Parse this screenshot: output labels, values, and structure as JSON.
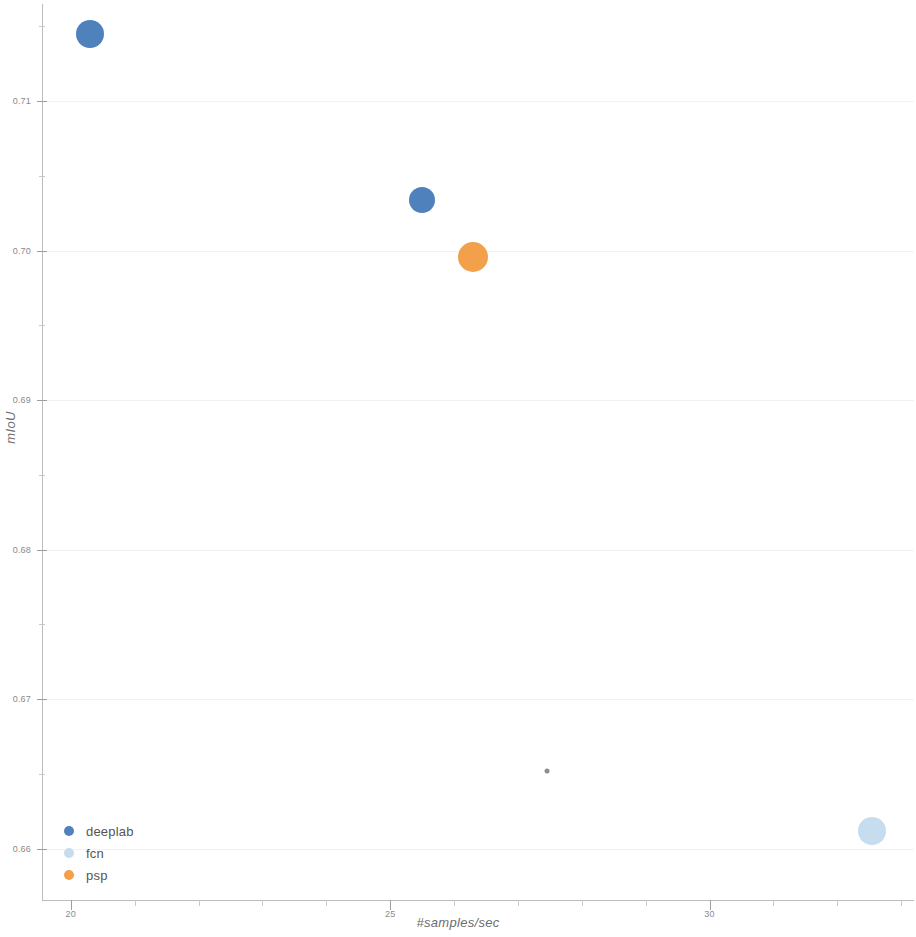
{
  "chart_data": {
    "type": "scatter",
    "title": "",
    "xlabel": "#samples/sec",
    "ylabel": "mIoU",
    "xlim": [
      19.55,
      33.2
    ],
    "ylim": [
      0.6565,
      0.7165
    ],
    "grid": true,
    "legend_position": "lower-left",
    "x_ticks": [
      {
        "value": 20,
        "label": "20"
      },
      {
        "value": 25,
        "label": "25"
      },
      {
        "value": 30,
        "label": "30"
      }
    ],
    "x_minor_ticks": [
      21,
      22,
      23,
      24,
      26,
      27,
      28,
      29,
      31,
      32,
      33
    ],
    "y_ticks": [
      {
        "value": 0.71,
        "label": "0.71"
      },
      {
        "value": 0.7,
        "label": "0.70"
      },
      {
        "value": 0.69,
        "label": "0.69"
      },
      {
        "value": 0.68,
        "label": "0.68"
      },
      {
        "value": 0.67,
        "label": "0.67"
      },
      {
        "value": 0.66,
        "label": "0.66"
      }
    ],
    "y_minor_ticks": [
      0.715,
      0.705,
      0.695,
      0.685,
      0.675,
      0.665
    ],
    "series": [
      {
        "name": "deeplab",
        "color": "#4f81bd",
        "points": [
          {
            "x": 20.3,
            "y": 0.7145,
            "size": 28
          },
          {
            "x": 25.5,
            "y": 0.7034,
            "size": 26
          }
        ]
      },
      {
        "name": "fcn",
        "color": "#c6dcef",
        "points": [
          {
            "x": 32.55,
            "y": 0.6612,
            "size": 28
          }
        ]
      },
      {
        "name": "psp",
        "color": "#f2a04a",
        "points": [
          {
            "x": 26.3,
            "y": 0.6996,
            "size": 30
          }
        ]
      },
      {
        "name": "marker-artifact",
        "color": "#8d8d8d",
        "points": [
          {
            "x": 27.45,
            "y": 0.6652,
            "size": 5
          }
        ]
      }
    ]
  },
  "legend": {
    "items": [
      {
        "label": "deeplab",
        "color": "#4f81bd"
      },
      {
        "label": "fcn",
        "color": "#c6dcef"
      },
      {
        "label": "psp",
        "color": "#f2a04a"
      }
    ]
  }
}
